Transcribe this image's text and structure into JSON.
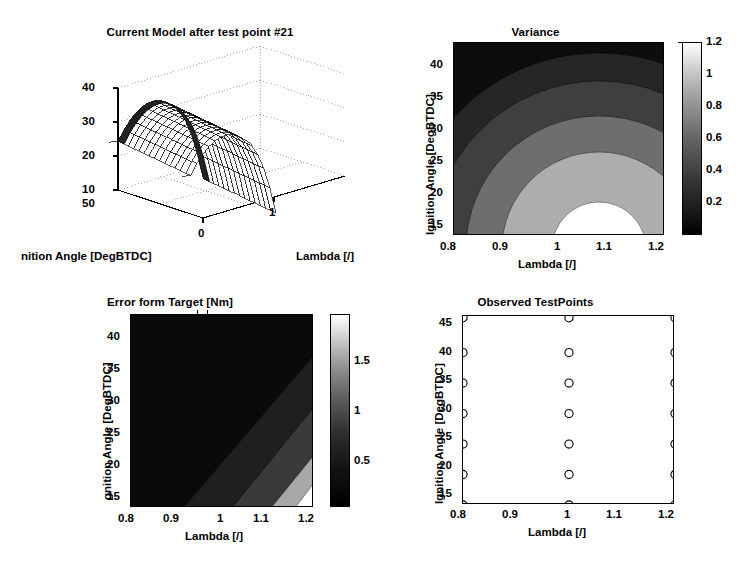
{
  "figure": {
    "background": "#ffffff",
    "layout": "2x2 MATLAB subplot figure"
  },
  "panels": {
    "model3d": {
      "title": "Current Model after test point #21",
      "xlabel": "Lambda [/]",
      "ylabel": "nition Angle [DegBTDC]",
      "ylabel_full": "Ignition Angle [DegBTDC]",
      "zticks": [
        "40",
        "30",
        "20",
        "10"
      ],
      "yticks": [
        "50"
      ],
      "xticks": [
        "0",
        "1"
      ]
    },
    "variance": {
      "title": "Variance",
      "xlabel": "Lambda [/]",
      "ylabel": "Ignition Angle [DegBTDC]",
      "xticks": [
        "0.8",
        "0.9",
        "1",
        "1.1",
        "1.2"
      ],
      "yticks": [
        "15",
        "20",
        "25",
        "30",
        "35",
        "40"
      ],
      "cbticks": [
        "0.2",
        "0.4",
        "0.6",
        "0.8",
        "1",
        "1.2"
      ]
    },
    "error": {
      "title": "Error form Target [Nm]",
      "xlabel": "Lambda [/]",
      "ylabel": "gnition Angle [DegBTDC]",
      "ylabel_full": "Ignition Angle [DegBTDC]",
      "xticks": [
        "0.8",
        "0.9",
        "1",
        "1.1",
        "1.2"
      ],
      "yticks": [
        "15",
        "20",
        "25",
        "30",
        "35",
        "40"
      ],
      "cbticks": [
        "0.5",
        "1",
        "1.5"
      ]
    },
    "testpoints": {
      "title": "Observed TestPoints",
      "xlabel": "Lambda [/]",
      "ylabel": "Ignition Angle [DegBTDC]",
      "xticks": [
        "0.8",
        "0.9",
        "1",
        "1.1",
        "1.2"
      ],
      "yticks": [
        "15",
        "20",
        "25",
        "30",
        "35",
        "40",
        "45"
      ]
    }
  },
  "chart_data": [
    {
      "id": "model3d",
      "type": "surface",
      "title": "Current Model after test point #21",
      "xlabel": "Lambda [/]",
      "ylabel": "Ignition Angle [DegBTDC]",
      "zlabel": "",
      "xlim": [
        0.8,
        1.2
      ],
      "ylim": [
        15,
        50
      ],
      "zlim": [
        10,
        40
      ],
      "xticks": [
        0,
        1
      ],
      "yticks": [
        50
      ],
      "zticks": [
        10,
        20,
        30,
        40
      ],
      "grid": true,
      "mesh_style": "wireframe black lines on white faces",
      "surface_shape": "ridge peaking near lambda=1, falling off toward lambda extremes; gentle decline with ignition angle",
      "z_peak_approx": 32,
      "z_min_approx": 12,
      "view": "azimuth -37.5, elevation 30"
    },
    {
      "id": "variance",
      "type": "heatmap",
      "title": "Variance",
      "xlabel": "Lambda [/]",
      "ylabel": "Ignition Angle [DegBTDC]",
      "xlim": [
        0.8,
        1.2
      ],
      "ylim": [
        15,
        45
      ],
      "xticks": [
        0.8,
        0.9,
        1.0,
        1.1,
        1.2
      ],
      "yticks": [
        15,
        20,
        25,
        30,
        35,
        40
      ],
      "colormap": "gray",
      "clim": [
        0.1,
        1.25
      ],
      "cbticks": [
        0.2,
        0.4,
        0.6,
        0.8,
        1.0,
        1.2
      ],
      "contour_levels": [
        0.2,
        0.4,
        0.6,
        0.8,
        1.0,
        1.2
      ],
      "band_values": [
        0.15,
        0.35,
        0.55,
        0.75,
        0.95,
        1.2
      ],
      "pattern": "concentric arcs centred near (lambda=1.1, angle=13); value increases toward bottom-centre-right; white maximum lobe at bottom near lambda 1.02-1.18",
      "corner_values": {
        "top_left": 0.14,
        "top_right": 0.3,
        "bottom_left": 0.82,
        "bottom_right": 1.05,
        "centre": 0.55
      }
    },
    {
      "id": "error",
      "type": "heatmap",
      "title": "Error form Target [Nm]",
      "xlabel": "Lambda [/]",
      "ylabel": "Ignition Angle [DegBTDC]",
      "xlim": [
        0.8,
        1.2
      ],
      "ylim": [
        15,
        45
      ],
      "xticks": [
        0.8,
        0.9,
        1.0,
        1.1,
        1.2
      ],
      "yticks": [
        15,
        20,
        25,
        30,
        35,
        40
      ],
      "colormap": "gray",
      "clim": [
        0.1,
        1.9
      ],
      "cbticks": [
        0.5,
        1.0,
        1.5
      ],
      "contour_levels": [
        0.5,
        1.0,
        1.5
      ],
      "band_values": [
        0.15,
        0.6,
        1.1,
        1.7
      ],
      "pattern": "diagonal bands parallel to anti-diagonal; near-zero over most of the domain, rising sharply toward the bottom-right corner (high lambda, low ignition angle); small white region at the bottom-right corner",
      "corner_values": {
        "top_left": 0.1,
        "top_right": 0.2,
        "bottom_left": 0.12,
        "bottom_right": 1.8,
        "centre": 0.15
      }
    },
    {
      "id": "testpoints",
      "type": "scatter",
      "title": "Observed TestPoints",
      "xlabel": "Lambda [/]",
      "ylabel": "Ignition Angle [DegBTDC]",
      "xlim": [
        0.8,
        1.2
      ],
      "ylim": [
        15,
        46
      ],
      "xticks": [
        0.8,
        0.9,
        1.0,
        1.1,
        1.2
      ],
      "yticks": [
        15,
        20,
        25,
        30,
        35,
        40,
        45
      ],
      "marker": "open circle",
      "marker_color": "#000000",
      "n_points": 21,
      "x": [
        0.8,
        0.8,
        0.8,
        0.8,
        0.8,
        0.8,
        0.8,
        1.0,
        1.0,
        1.0,
        1.0,
        1.0,
        1.0,
        1.0,
        1.2,
        1.2,
        1.2,
        1.2,
        1.2,
        1.2,
        1.2
      ],
      "y": [
        15,
        20,
        25,
        30,
        35,
        40,
        45.7,
        15,
        20,
        25,
        30,
        35,
        40,
        45.7,
        15,
        20,
        25,
        30,
        35,
        40,
        45.7
      ]
    }
  ]
}
